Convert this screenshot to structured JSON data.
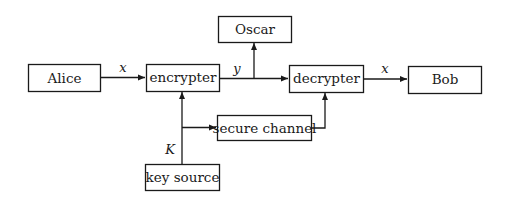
{
  "diagram": {
    "nodes": {
      "alice": {
        "label": "Alice"
      },
      "encrypter": {
        "label": "encrypter"
      },
      "oscar": {
        "label": "Oscar"
      },
      "decrypter": {
        "label": "decrypter"
      },
      "bob": {
        "label": "Bob"
      },
      "secure_channel": {
        "label": "secure channel"
      },
      "key_source": {
        "label": "key source"
      }
    },
    "edges": {
      "alice_to_encrypter": {
        "label": "x"
      },
      "encrypter_to_decrypter": {
        "label": "y"
      },
      "decrypter_to_bob": {
        "label": "x"
      },
      "key_source_to_encrypter": {
        "label": "K"
      }
    }
  }
}
